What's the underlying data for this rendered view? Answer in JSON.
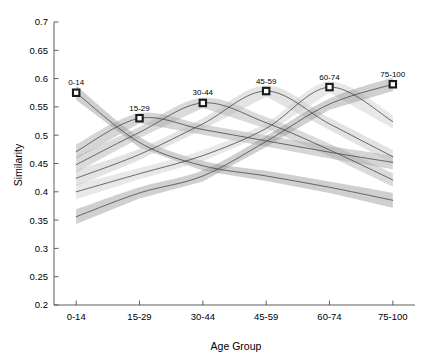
{
  "chart_data": {
    "type": "line",
    "title": "",
    "xlabel": "Age Group",
    "ylabel": "Similarity",
    "categories": [
      "0-14",
      "15-29",
      "30-44",
      "45-59",
      "60-74",
      "75-100"
    ],
    "x": [
      1,
      2,
      3,
      4,
      5,
      6
    ],
    "xlim": [
      0.65,
      6.35
    ],
    "ylim": [
      0.2,
      0.7
    ],
    "yticks": [
      0.2,
      0.25,
      0.3,
      0.35,
      0.4,
      0.45,
      0.5,
      0.55,
      0.6,
      0.65,
      0.7
    ],
    "ytick_labels": [
      "0.2",
      "0.25",
      "0.3",
      "0.35",
      "0.4",
      "0.45",
      "0.5",
      "0.55",
      "0.6",
      "0.65",
      "0.7"
    ],
    "xtick_labels": [
      "0-14",
      "15-29",
      "30-44",
      "45-59",
      "60-74",
      "75-100"
    ],
    "grid": false,
    "legend_position": "none",
    "band_type": "confidence-interval",
    "annotations": [
      {
        "label": "0-14",
        "x": 1,
        "y": 0.575
      },
      {
        "label": "15-29",
        "x": 2,
        "y": 0.53
      },
      {
        "label": "30-44",
        "x": 3,
        "y": 0.557
      },
      {
        "label": "45-59",
        "x": 4,
        "y": 0.578
      },
      {
        "label": "60-74",
        "x": 5,
        "y": 0.585
      },
      {
        "label": "75-100",
        "x": 6,
        "y": 0.59
      }
    ],
    "series": [
      {
        "name": "0-14",
        "color": "#8c8c8c",
        "values": [
          0.575,
          0.487,
          0.446,
          0.428,
          0.408,
          0.385
        ],
        "lower": [
          0.562,
          0.478,
          0.437,
          0.419,
          0.398,
          0.372
        ],
        "upper": [
          0.588,
          0.497,
          0.455,
          0.437,
          0.418,
          0.398
        ]
      },
      {
        "name": "15-29",
        "color": "#9a9a9a",
        "values": [
          0.471,
          0.53,
          0.51,
          0.49,
          0.47,
          0.452
        ],
        "lower": [
          0.458,
          0.521,
          0.501,
          0.48,
          0.459,
          0.44
        ],
        "upper": [
          0.484,
          0.539,
          0.519,
          0.5,
          0.481,
          0.464
        ]
      },
      {
        "name": "30-44",
        "color": "#a6a6a6",
        "values": [
          0.448,
          0.505,
          0.557,
          0.522,
          0.474,
          0.421
        ],
        "lower": [
          0.434,
          0.495,
          0.548,
          0.512,
          0.463,
          0.409
        ],
        "upper": [
          0.462,
          0.515,
          0.566,
          0.532,
          0.485,
          0.433
        ]
      },
      {
        "name": "45-59",
        "color": "#bdbdbd",
        "values": [
          0.424,
          0.466,
          0.52,
          0.578,
          0.52,
          0.462
        ],
        "lower": [
          0.41,
          0.456,
          0.51,
          0.568,
          0.509,
          0.45
        ],
        "upper": [
          0.438,
          0.476,
          0.53,
          0.588,
          0.531,
          0.474
        ]
      },
      {
        "name": "60-74",
        "color": "#c9c9c9",
        "values": [
          0.4,
          0.432,
          0.464,
          0.512,
          0.585,
          0.524
        ],
        "lower": [
          0.387,
          0.422,
          0.454,
          0.502,
          0.575,
          0.512
        ],
        "upper": [
          0.413,
          0.442,
          0.474,
          0.522,
          0.595,
          0.536
        ]
      },
      {
        "name": "75-100",
        "color": "#8f8f8f",
        "values": [
          0.356,
          0.398,
          0.428,
          0.489,
          0.555,
          0.59
        ],
        "lower": [
          0.343,
          0.388,
          0.418,
          0.479,
          0.545,
          0.578
        ],
        "upper": [
          0.369,
          0.408,
          0.438,
          0.499,
          0.565,
          0.602
        ]
      }
    ]
  },
  "axes": {
    "x_title": "Age Group",
    "y_title": "Similarity"
  }
}
